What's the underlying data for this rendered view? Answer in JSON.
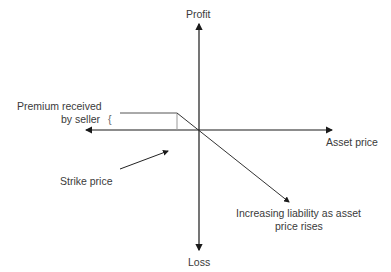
{
  "diagram": {
    "axes": {
      "y_top_label": "Profit",
      "y_bottom_label": "Loss",
      "x_right_label": "Asset price"
    },
    "annotations": {
      "premium_line1": "Premium received",
      "premium_line2": "by seller",
      "premium_brace": "{",
      "strike": "Strike price",
      "liability_line1": "Increasing liability as asset",
      "liability_line2": "price rises"
    },
    "colors": {
      "axis": "#1a1a1a",
      "payoff": "#555555",
      "text": "#3a3a3a"
    }
  }
}
